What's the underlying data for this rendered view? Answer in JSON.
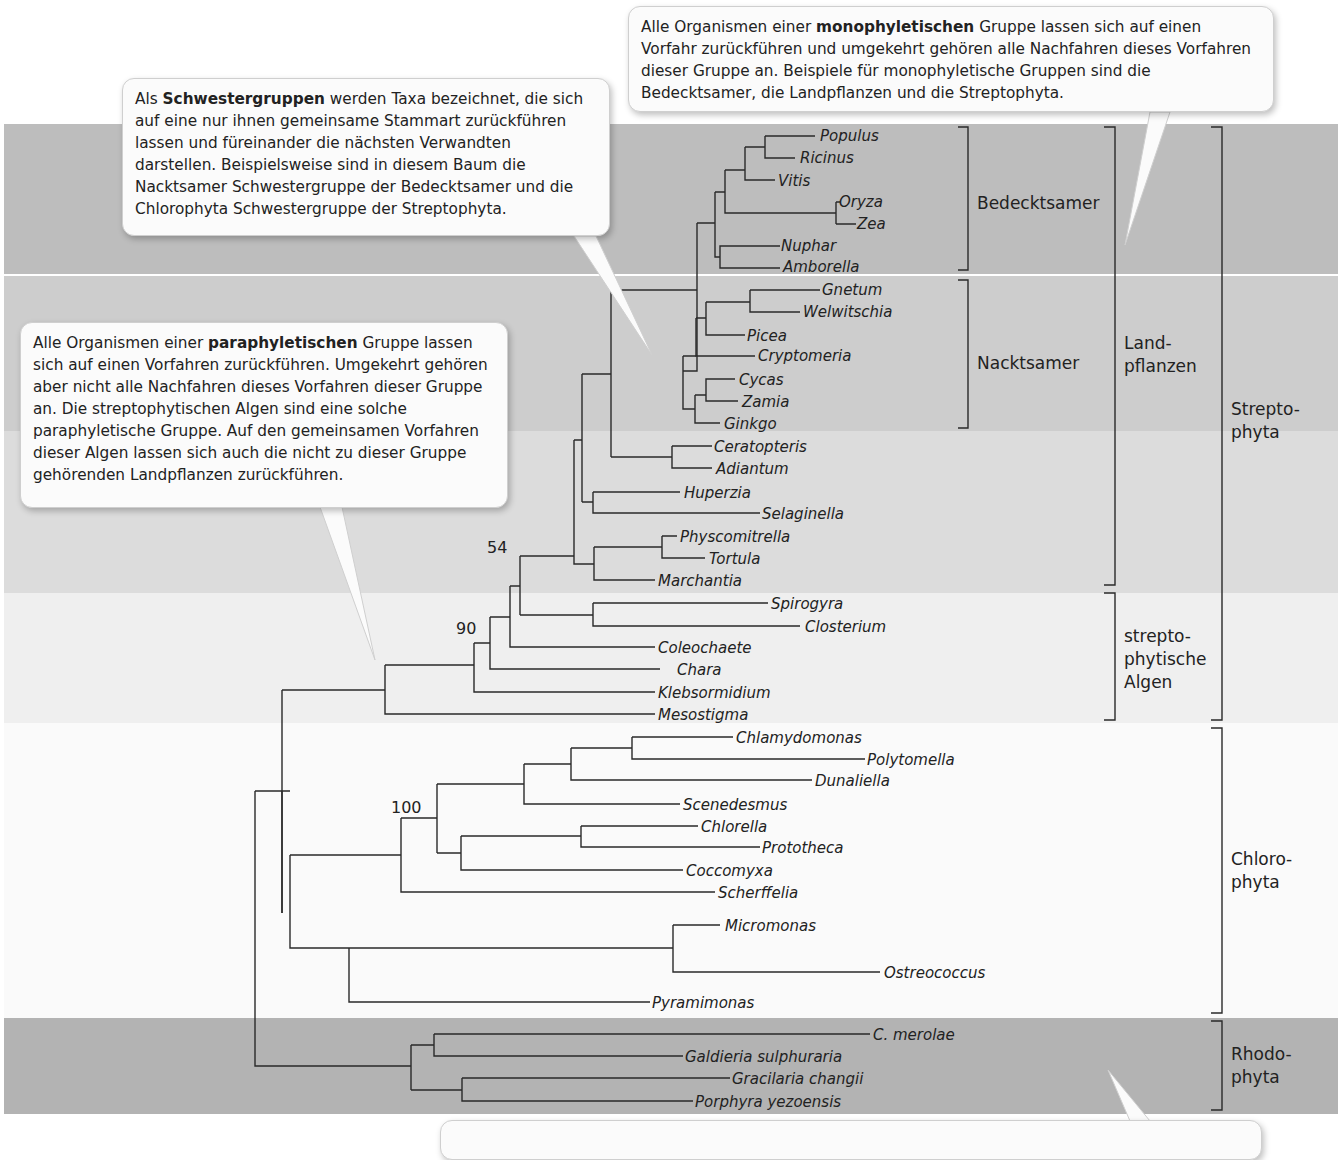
{
  "callouts": {
    "monophyletic": {
      "pre": "Alle Organismen einer ",
      "bold": "monophyletischen",
      "post": " Gruppe lassen sich auf einen Vorfahr zurückführen und umgekehrt gehören alle Nachfahren dieses Vorfahren dieser Gruppe an. Beispiele für monophyletische Gruppen sind die Bedecktsamer, die Landpflanzen und die Streptophyta."
    },
    "sister": {
      "pre": "Als ",
      "bold": "Schwestergruppen",
      "post": " werden Taxa bezeichnet, die sich auf eine nur ihnen gemeinsame Stammart zurückführen lassen und füreinander die nächsten Verwandten darstellen. Beispielsweise sind in diesem Baum die Nacktsamer Schwestergruppe der Bedecktsamer und die Chlorophyta Schwestergruppe der Streptophyta."
    },
    "paraphyletic": {
      "pre": "Alle Organismen einer ",
      "bold": "paraphyletischen",
      "post": " Gruppe lassen sich auf einen Vorfahren zurückführen. Umgekehrt gehören aber nicht alle Nachfahren dieses Vorfahren dieser Gruppe an. Die streptophytischen Algen sind eine solche paraphyletische Gruppe. Auf den gemeinsamen Vorfahren dieser Algen lassen sich auch die nicht zu dieser Gruppe gehörenden Landpflanzen zurückführen."
    },
    "bottom": {
      "text": ""
    }
  },
  "groups": {
    "bedecktsamer": "Bedecktsamer",
    "nacktsamer": "Nacktsamer",
    "landpflanzen_1": "Land-",
    "landpflanzen_2": "pflanzen",
    "streptophytische_1": "strepto-",
    "streptophytische_2": "phytische",
    "streptophytische_3": "Algen",
    "streptophyta_1": "Strepto-",
    "streptophyta_2": "phyta",
    "chlorophyta_1": "Chloro-",
    "chlorophyta_2": "phyta",
    "rhodophyta_1": "Rhodo-",
    "rhodophyta_2": "phyta"
  },
  "support_values": [
    "54",
    "90",
    "100"
  ],
  "taxa": [
    "Populus",
    "Ricinus",
    "Vitis",
    "Oryza",
    "Zea",
    "Nuphar",
    "Amborella",
    "Gnetum",
    "Welwitschia",
    "Picea",
    "Cryptomeria",
    "Cycas",
    "Zamia",
    "Ginkgo",
    "Ceratopteris",
    "Adiantum",
    "Huperzia",
    "Selaginella",
    "Physcomitrella",
    "Tortula",
    "Marchantia",
    "Spirogyra",
    "Closterium",
    "Coleochaete",
    "Chara",
    "Klebsormidium",
    "Mesostigma",
    "Chlamydomonas",
    "Polytomella",
    "Dunaliella",
    "Scenedesmus",
    "Chlorella",
    "Prototheca",
    "Coccomyxa",
    "Scherffelia",
    "Micromonas",
    "Ostreococcus",
    "Pyramimonas",
    "C. merolae",
    "Galdieria sulphuraria",
    "Gracilaria changii",
    "Porphyra yezoensis"
  ],
  "colors": {
    "angiosperm_band": "#bdbdbd",
    "landplant_band": "#d6d6d6",
    "algae_band": "#eeeeee",
    "rhodophyta_band": "#b3b3b3",
    "line": "#2a2a2a"
  }
}
